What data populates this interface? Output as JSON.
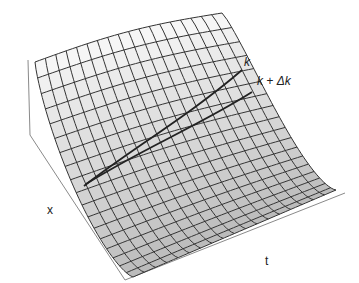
{
  "figure": {
    "type": "3d-surface-mesh",
    "axis_labels": {
      "x": "x",
      "t": "t"
    },
    "curves": [
      {
        "label": "k",
        "color": "#222222"
      },
      {
        "label": "k + Δk",
        "color": "#222222"
      }
    ],
    "grid": {
      "rows": 18,
      "cols": 18
    },
    "colors": {
      "mesh_line": "#333333",
      "surface_high": "#f4f4f4",
      "surface_low": "#bdbdbd",
      "base_line": "#888888"
    }
  }
}
